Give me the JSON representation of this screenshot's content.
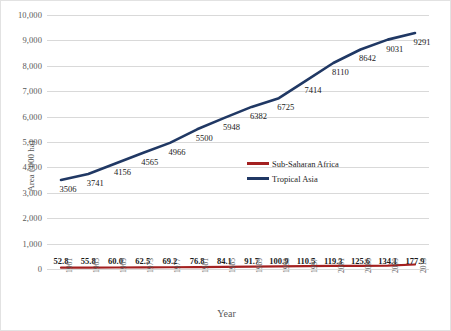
{
  "chart_data": {
    "type": "line",
    "title": "",
    "xlabel": "Year",
    "ylabel": "Area ('000 ha)",
    "categories": [
      "1961",
      "1965",
      "1969",
      "1973",
      "1977",
      "1981",
      "1985",
      "1989",
      "1993",
      "1997",
      "2001",
      "2005",
      "2009",
      "2013"
    ],
    "ylim": [
      0,
      10000
    ],
    "yticks": [
      "0",
      "1,000",
      "2,000",
      "3,000",
      "4,000",
      "5,000",
      "6,000",
      "7,000",
      "8,000",
      "9,000",
      "10,000"
    ],
    "ytick_values": [
      0,
      1000,
      2000,
      3000,
      4000,
      5000,
      6000,
      7000,
      8000,
      9000,
      10000
    ],
    "grid": "horizontal",
    "legend_position": "center-right-inside",
    "series": [
      {
        "name": "Sub-Saharan Africa",
        "color": "#A32020",
        "values": [
          52.8,
          55.8,
          60.0,
          62.5,
          69.2,
          76.8,
          84.1,
          91.7,
          100.9,
          110.5,
          119.3,
          125.6,
          134.1,
          177.9
        ],
        "labels": [
          "52.8",
          "55.8",
          "60.0",
          "62.5",
          "69.2",
          "76.8",
          "84.1",
          "91.7",
          "100.9",
          "110.5",
          "119.3",
          "125.6",
          "134.1",
          "177.9"
        ]
      },
      {
        "name": "Tropical Asia",
        "color": "#203864",
        "values": [
          3506,
          3741,
          4156,
          4565,
          4966,
          5500,
          5948,
          6382,
          6725,
          7414,
          8110,
          8642,
          9031,
          9291
        ],
        "labels": [
          "3506",
          "3741",
          "4156",
          "4565",
          "4966",
          "5500",
          "5948",
          "6382",
          "6725",
          "7414",
          "8110",
          "8642",
          "9031",
          "9291"
        ]
      }
    ]
  }
}
